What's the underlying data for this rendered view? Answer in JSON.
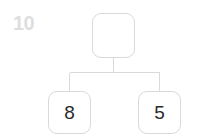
{
  "canvas": {
    "width": 197,
    "height": 139,
    "background": "#ffffff"
  },
  "corner_label": {
    "text": "10",
    "color": "#dedede"
  },
  "diagram": {
    "type": "binary-tree",
    "edge_color": "#d9d9d9",
    "node_border_color": "#d9d9d9",
    "node_fill_color": "#ffffff",
    "node_text_color": "#2b2b2b",
    "nodes": [
      {
        "id": "root",
        "label": "",
        "role": "parent"
      },
      {
        "id": "left",
        "label": "8",
        "role": "child"
      },
      {
        "id": "right",
        "label": "5",
        "role": "child"
      }
    ],
    "edges": [
      {
        "from": "root",
        "to": "left"
      },
      {
        "from": "root",
        "to": "right"
      }
    ]
  }
}
